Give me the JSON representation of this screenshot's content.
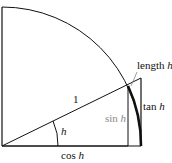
{
  "diagram": {
    "labels": {
      "radius": "1",
      "angle": "h",
      "sin_prefix": "sin ",
      "sin_var": "h",
      "cos_prefix": "cos ",
      "cos_var": "h",
      "tan_prefix": "tan ",
      "tan_var": "h",
      "arc_prefix": "length ",
      "arc_var": "h"
    },
    "colors": {
      "line": "#111111",
      "sin_label": "#888888",
      "background": "#ffffff"
    }
  }
}
